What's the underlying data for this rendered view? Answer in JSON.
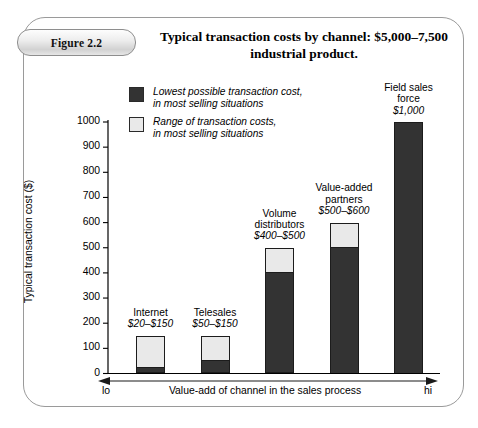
{
  "figure": {
    "badge_label": "Figure 2.2",
    "title_line1": "Typical transaction costs by channel: $5,000–7,500",
    "title_line2": "industrial product."
  },
  "legend": {
    "items": [
      {
        "swatch": "dark-swatch-icon",
        "color": "#333333",
        "text": "Lowest possible transaction cost,\nin most selling situations"
      },
      {
        "swatch": "light-swatch-icon",
        "color": "#e9e9e9",
        "text": "Range of transaction costs,\nin most selling situations"
      }
    ]
  },
  "axes": {
    "y_title": "Typical transaction cost ($)",
    "y_ticks": [
      "1000",
      "900",
      "800",
      "700",
      "600",
      "500",
      "400",
      "300",
      "200",
      "100",
      "0"
    ],
    "x_title": "Value-add of channel in the sales process",
    "x_low": "lo",
    "x_high": "hi"
  },
  "chart_data": {
    "type": "bar",
    "title": "Typical transaction costs by channel: $5,000–7,500 industrial product.",
    "xlabel": "Value-add of channel in the sales process",
    "ylabel": "Typical transaction cost ($)",
    "ylim": [
      0,
      1000
    ],
    "ytick_step": 100,
    "grid": false,
    "legend_position": "top-left-inside",
    "stacked": true,
    "categories": [
      "Internet",
      "Telesales",
      "Volume distributors",
      "Value-added partners",
      "Field sales force"
    ],
    "series": [
      {
        "name": "Lowest possible transaction cost, in most selling situations",
        "color": "#333333",
        "values": [
          20,
          50,
          400,
          500,
          1000
        ]
      },
      {
        "name": "Range of transaction costs, in most selling situations",
        "color": "#e9e9e9",
        "values": [
          130,
          100,
          100,
          100,
          0
        ]
      }
    ],
    "bars": [
      {
        "label_line1": "Internet",
        "range_label": "$20–$150",
        "low": 20,
        "high": 150
      },
      {
        "label_line1": "Telesales",
        "range_label": "$50–$150",
        "low": 50,
        "high": 150
      },
      {
        "label_line1": "Volume",
        "label_line2": "distributors",
        "range_label": "$400–$500",
        "low": 400,
        "high": 500
      },
      {
        "label_line1": "Value-added",
        "label_line2": "partners",
        "range_label": "$500–$600",
        "low": 500,
        "high": 600
      },
      {
        "label_line1": "Field sales",
        "label_line2": "force",
        "range_label": "$1,000",
        "low": 1000,
        "high": 1000
      }
    ]
  }
}
